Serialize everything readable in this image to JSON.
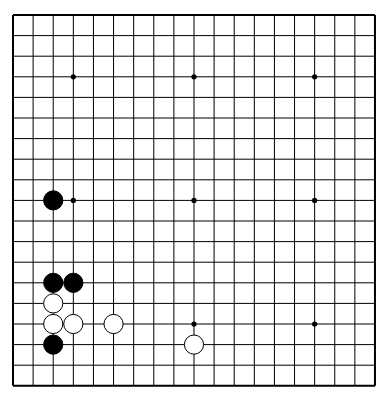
{
  "board": {
    "size": 19,
    "origin_x": 13,
    "origin_y": 15,
    "spacing_x": 20.11,
    "spacing_y": 20.6,
    "line_color": "#000000",
    "background": "#ffffff",
    "star_points": [
      [
        3,
        3
      ],
      [
        9,
        3
      ],
      [
        15,
        3
      ],
      [
        3,
        9
      ],
      [
        9,
        9
      ],
      [
        15,
        9
      ],
      [
        3,
        15
      ],
      [
        9,
        15
      ],
      [
        15,
        15
      ]
    ],
    "stones": [
      {
        "color": "black",
        "col": 2,
        "row": 9
      },
      {
        "color": "black",
        "col": 2,
        "row": 13
      },
      {
        "color": "black",
        "col": 3,
        "row": 13
      },
      {
        "color": "white",
        "col": 2,
        "row": 14
      },
      {
        "color": "white",
        "col": 2,
        "row": 15
      },
      {
        "color": "white",
        "col": 3,
        "row": 15
      },
      {
        "color": "white",
        "col": 5,
        "row": 15
      },
      {
        "color": "black",
        "col": 2,
        "row": 16
      },
      {
        "color": "white",
        "col": 9,
        "row": 16
      }
    ]
  }
}
